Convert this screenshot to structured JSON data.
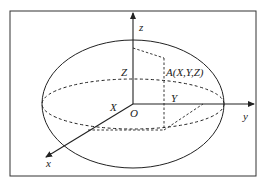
{
  "diagram": {
    "labels": {
      "z_axis": "z",
      "y_axis": "y",
      "x_axis": "x",
      "origin": "O",
      "X": "X",
      "Y": "Y",
      "Z": "Z",
      "point": "A(X,Y,Z)"
    },
    "colors": {
      "stroke": "#222222",
      "frame": "#333333",
      "background": "#ffffff"
    }
  }
}
